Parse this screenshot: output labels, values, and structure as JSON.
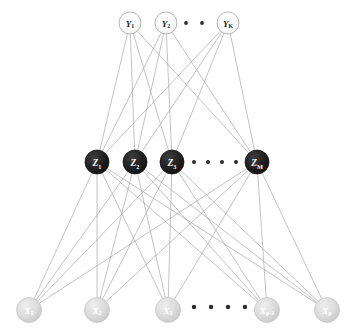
{
  "diagram": {
    "type": "neural-network",
    "layer_count": 3,
    "edge_color": "#9a9a9a",
    "edge_width": 0.6,
    "background": "#ffffff"
  },
  "layers": {
    "output": {
      "name": "output-layer",
      "symbol": "Y",
      "y": 23,
      "radius": 11,
      "fill": "#f7f7f7",
      "stroke": "#9a9a9a",
      "text_color": "#1a1a1a",
      "font_size": 9,
      "nodes": [
        {
          "id": "Y1",
          "label": "Y",
          "sub": "1",
          "x": 130
        },
        {
          "id": "Y2",
          "label": "Y",
          "sub": "2",
          "x": 166
        },
        {
          "id": "YK",
          "label": "Y",
          "sub": "K",
          "x": 228
        }
      ],
      "ellipsis": {
        "dots": 2,
        "x_start": 186,
        "x_step": 16,
        "y": 23,
        "r": 1.9,
        "color": "#2b2b2b"
      }
    },
    "hidden": {
      "name": "hidden-layer",
      "symbol": "Z",
      "y": 162,
      "radius": 12,
      "fill": "#262626",
      "stroke": "#151515",
      "text_color": "#ffffff",
      "font_size": 9.5,
      "nodes": [
        {
          "id": "Z1",
          "label": "Z",
          "sub": "1",
          "x": 97
        },
        {
          "id": "Z2",
          "label": "Z",
          "sub": "2",
          "x": 135
        },
        {
          "id": "Z3",
          "label": "Z",
          "sub": "3",
          "x": 172
        },
        {
          "id": "ZM",
          "label": "Z",
          "sub": "M",
          "x": 257
        }
      ],
      "ellipsis": {
        "dots": 4,
        "x_start": 194,
        "x_step": 14,
        "y": 162,
        "r": 2.0,
        "color": "#2b2b2b"
      }
    },
    "input": {
      "name": "input-layer",
      "symbol": "X",
      "y": 310,
      "radius": 12.5,
      "fill": "#d9d9d9",
      "stroke": "#c2c2c2",
      "text_color": "#ffffff",
      "font_size": 9,
      "nodes": [
        {
          "id": "X1",
          "label": "X",
          "sub": "1",
          "x": 29
        },
        {
          "id": "X2",
          "label": "X",
          "sub": "2",
          "x": 97
        },
        {
          "id": "X3",
          "label": "X",
          "sub": "3",
          "x": 168
        },
        {
          "id": "Xp1",
          "label": "X",
          "sub": "p-1",
          "x": 267
        },
        {
          "id": "Xp",
          "label": "X",
          "sub": "p",
          "x": 327
        }
      ],
      "ellipsis": {
        "dots": 4,
        "x_start": 194,
        "x_step": 17,
        "y": 307,
        "r": 2.2,
        "color": "#2b2b2b"
      }
    }
  }
}
